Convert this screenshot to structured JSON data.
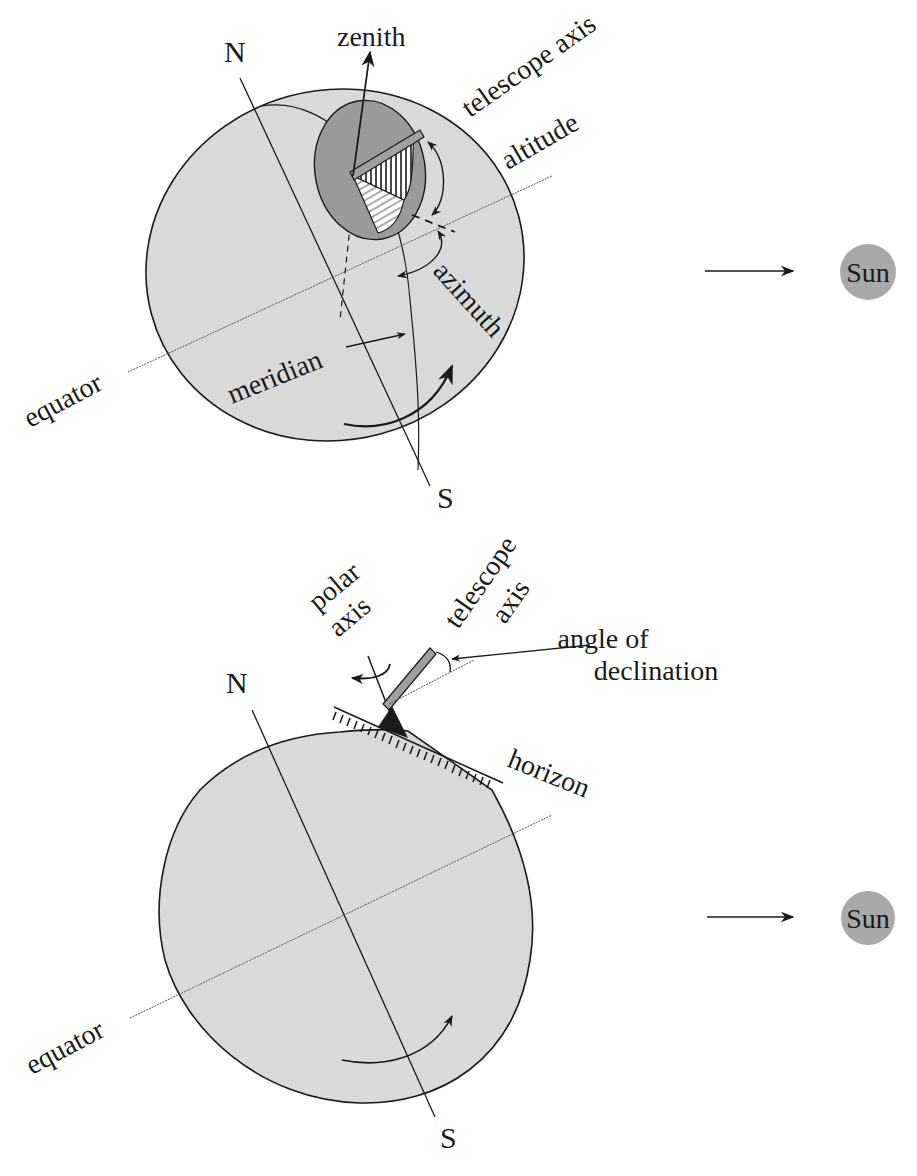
{
  "figure": {
    "colors": {
      "globe_fill": "#d9d9d9",
      "disc_fill": "#9a9a9a",
      "sun_fill": "#a9a9a9",
      "ink": "#1a1a1a",
      "tube_fill": "#a0a0a0"
    },
    "top_diagram": {
      "labels": {
        "north": "N",
        "south": "S",
        "zenith": "zenith",
        "telescope_axis": "telescope axis",
        "altitude": "altitude",
        "azimuth": "azimuth",
        "meridian": "meridian",
        "equator": "equator",
        "sun": "Sun"
      }
    },
    "bottom_diagram": {
      "labels": {
        "north": "N",
        "south": "S",
        "polar_axis_line1": "polar",
        "polar_axis_line2": "axis",
        "telescope_axis_line1": "telescope",
        "telescope_axis_line2": "axis",
        "angle_of_declination_line1": "angle of",
        "angle_of_declination_line2": "declination",
        "horizon": "horizon",
        "equator": "equator",
        "sun": "Sun"
      }
    }
  }
}
